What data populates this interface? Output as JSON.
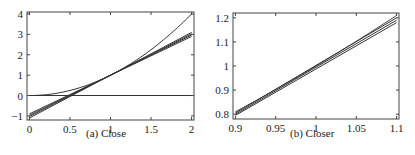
{
  "chart_data": [
    {
      "type": "line",
      "title": "",
      "caption": "(a) Close",
      "xlabel": "",
      "ylabel": "",
      "xlim": [
        -0.03,
        2.03
      ],
      "ylim": [
        -1.2,
        4.1
      ],
      "xticks": [
        0,
        0.5,
        1,
        1.5,
        2
      ],
      "xtick_labels": [
        "0",
        "0.5",
        "1",
        "1.5",
        "2"
      ],
      "yticks": [
        -1,
        0,
        1,
        2,
        3,
        4
      ],
      "ytick_labels": [
        "−1",
        "0",
        "1",
        "2",
        "3",
        "4"
      ],
      "grid": false,
      "legend": null,
      "series": [
        {
          "name": "curve",
          "kind": "function",
          "expr": "x^2",
          "x": [
            0,
            0.25,
            0.5,
            0.75,
            1,
            1.25,
            1.5,
            1.75,
            2
          ],
          "values": [
            0,
            0.0625,
            0.25,
            0.5625,
            1,
            1.5625,
            2.25,
            3.0625,
            4
          ]
        },
        {
          "name": "zero-line",
          "x": [
            0,
            2
          ],
          "values": [
            0,
            0
          ]
        },
        {
          "name": "line-1",
          "x": [
            0,
            2
          ],
          "values": [
            -0.9,
            2.9
          ]
        },
        {
          "name": "line-2",
          "x": [
            0,
            2
          ],
          "values": [
            -0.97,
            2.97
          ]
        },
        {
          "name": "line-3",
          "x": [
            0,
            2
          ],
          "values": [
            -1.03,
            3.03
          ]
        },
        {
          "name": "line-4",
          "x": [
            0,
            2
          ],
          "values": [
            -1.1,
            3.1
          ]
        }
      ]
    },
    {
      "type": "line",
      "title": "",
      "caption": "(b) Closer",
      "xlabel": "",
      "ylabel": "",
      "xlim": [
        0.897,
        1.103
      ],
      "ylim": [
        0.78,
        1.22
      ],
      "xticks": [
        0.9,
        0.95,
        1,
        1.05,
        1.1
      ],
      "xtick_labels": [
        "0.9",
        "0.95",
        "1",
        "1.05",
        "1.1"
      ],
      "yticks": [
        0.8,
        0.9,
        1,
        1.1,
        1.2
      ],
      "ytick_labels": [
        "0.8",
        "0.9",
        "1",
        "1.1",
        "1.2"
      ],
      "grid": false,
      "legend": null,
      "series": [
        {
          "name": "curve",
          "kind": "function",
          "expr": "x^2",
          "x": [
            0.9,
            0.95,
            1,
            1.05,
            1.1
          ],
          "values": [
            0.81,
            0.9025,
            1,
            1.1025,
            1.21
          ]
        },
        {
          "name": "line-1",
          "x": [
            0.9,
            1.1
          ],
          "values": [
            0.805,
            1.2
          ]
        },
        {
          "name": "line-2",
          "x": [
            0.9,
            1.1
          ],
          "values": [
            0.8,
            1.19
          ]
        },
        {
          "name": "line-3",
          "x": [
            0.9,
            1.1
          ],
          "values": [
            0.795,
            1.18
          ]
        }
      ]
    }
  ],
  "captions": {
    "left": "(a) Close",
    "right": "(b) Closer"
  }
}
